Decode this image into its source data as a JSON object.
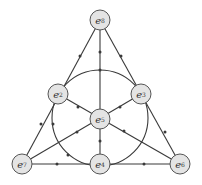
{
  "diagram": {
    "type": "fano-plane",
    "colors": {
      "line": "#3a3a3a",
      "node_fill": "#e4e4e4",
      "node_stroke": "#555555",
      "text": "#333333"
    },
    "nodes": [
      {
        "id": "top",
        "base": "e",
        "sub": "8",
        "x": 100,
        "y": 20
      },
      {
        "id": "left",
        "base": "e",
        "sub": "2",
        "x": 58,
        "y": 94
      },
      {
        "id": "right",
        "base": "e",
        "sub": "3",
        "x": 141,
        "y": 94
      },
      {
        "id": "center",
        "base": "e",
        "sub": "5",
        "x": 100,
        "y": 119
      },
      {
        "id": "bottom-left",
        "base": "e",
        "sub": "7",
        "x": 22,
        "y": 164
      },
      {
        "id": "bottom-mid",
        "base": "e",
        "sub": "4",
        "x": 100,
        "y": 164
      },
      {
        "id": "bottom-right",
        "base": "e",
        "sub": "6",
        "x": 180,
        "y": 164
      }
    ]
  }
}
